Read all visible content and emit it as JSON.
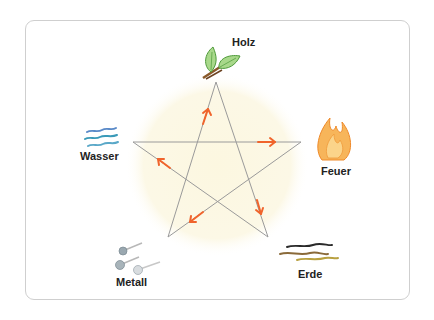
{
  "diagram": {
    "type": "five-elements-cycle",
    "elements": [
      {
        "id": "holz",
        "label": "Holz",
        "icon": "leaf-branch-icon"
      },
      {
        "id": "feuer",
        "label": "Feuer",
        "icon": "flame-icon"
      },
      {
        "id": "erde",
        "label": "Erde",
        "icon": "earth-strokes-icon"
      },
      {
        "id": "metall",
        "label": "Metall",
        "icon": "metal-nails-icon"
      },
      {
        "id": "wasser",
        "label": "Wasser",
        "icon": "water-waves-icon"
      }
    ],
    "cycle_arrows": [
      {
        "from": "Holz",
        "to": "Feuer"
      },
      {
        "from": "Feuer",
        "to": "Erde"
      },
      {
        "from": "Erde",
        "to": "Metall"
      },
      {
        "from": "Metall",
        "to": "Wasser"
      },
      {
        "from": "Wasser",
        "to": "Holz"
      }
    ],
    "colors": {
      "star_line": "#9a9a9a",
      "arrow": "#f0642c",
      "background_glow": "#fbf6df",
      "frame_border": "#cfcfcf"
    }
  }
}
